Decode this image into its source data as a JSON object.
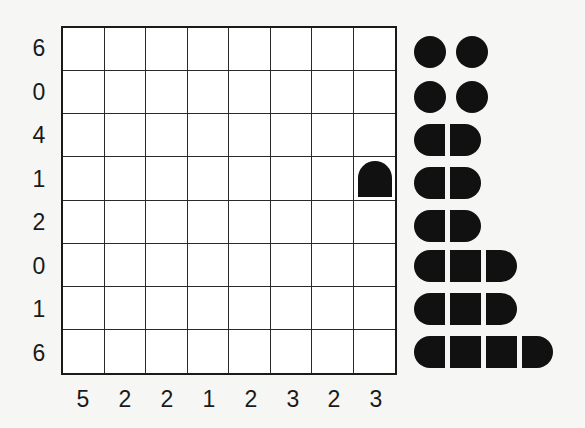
{
  "puzzle": {
    "type": "battleships",
    "rows": 8,
    "cols": 8,
    "row_clues": [
      "6",
      "0",
      "4",
      "1",
      "2",
      "0",
      "1",
      "6"
    ],
    "col_clues": [
      "5",
      "2",
      "2",
      "1",
      "2",
      "3",
      "2",
      "3"
    ],
    "given_cells": [
      {
        "row": 4,
        "col": 8,
        "piece": "end-top"
      }
    ]
  },
  "fleet": [
    {
      "size": 1,
      "label": "submarine"
    },
    {
      "size": 1,
      "label": "submarine"
    },
    {
      "size": 1,
      "label": "submarine"
    },
    {
      "size": 1,
      "label": "submarine"
    },
    {
      "size": 2,
      "label": "destroyer"
    },
    {
      "size": 2,
      "label": "destroyer"
    },
    {
      "size": 2,
      "label": "destroyer"
    },
    {
      "size": 3,
      "label": "cruiser"
    },
    {
      "size": 3,
      "label": "cruiser"
    },
    {
      "size": 4,
      "label": "battleship"
    }
  ],
  "colors": {
    "background": "#f6f6f4",
    "grid": "#1a1a1a",
    "ship": "#111111"
  }
}
